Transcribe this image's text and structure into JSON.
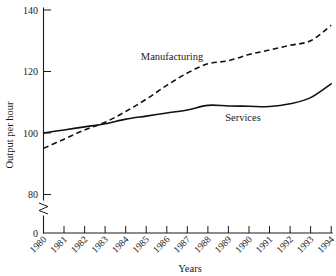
{
  "chart_data": {
    "type": "line",
    "title": "",
    "xlabel": "Years",
    "ylabel": "Output per hour",
    "x": [
      1980,
      1981,
      1982,
      1983,
      1984,
      1985,
      1986,
      1987,
      1988,
      1989,
      1990,
      1991,
      1992,
      1993,
      1994
    ],
    "categories": [
      "1980",
      "1981",
      "1982",
      "1983",
      "1984",
      "1985",
      "1986",
      "1987",
      "1988",
      "1989",
      "1990",
      "1991",
      "1992",
      "1993",
      "1994"
    ],
    "series": [
      {
        "name": "Manufacturing",
        "style": "dashed",
        "values": [
          95,
          98,
          101,
          103.5,
          107,
          111,
          115.5,
          119.5,
          122.5,
          123.5,
          125.5,
          127,
          128.5,
          130,
          135
        ]
      },
      {
        "name": "Services",
        "style": "solid",
        "values": [
          100,
          101,
          102,
          103,
          104.5,
          105.5,
          106.5,
          107.5,
          109,
          108.8,
          108.7,
          108.6,
          109.5,
          111.5,
          116
        ]
      }
    ],
    "ylim": [
      0,
      140
    ],
    "y_ticks": [
      0,
      80,
      100,
      120,
      140
    ],
    "y_tick_labels": [
      "0",
      "80",
      "100",
      "120",
      "140"
    ],
    "y_axis_break": true,
    "y_axis_break_between": [
      0,
      80
    ],
    "xlim": [
      1980,
      1994
    ],
    "grid": false,
    "legend": "inline-annotations",
    "annotations": [
      {
        "text": "Manufacturing",
        "x": 1986.1,
        "y": 127.8
      },
      {
        "text": "Services",
        "x": 1990.2,
        "y": 106.0
      }
    ],
    "line_color": "#111111"
  },
  "axis": {
    "y_title": "Output per hour",
    "x_title": "Years"
  },
  "ticks": {
    "y": [
      "140",
      "120",
      "100",
      "80",
      "0"
    ],
    "x": [
      "1980",
      "1981",
      "1982",
      "1983",
      "1984",
      "1985",
      "1986",
      "1987",
      "1988",
      "1989",
      "1990",
      "1991",
      "1992",
      "1993",
      "1994"
    ]
  },
  "labels": {
    "manufacturing": "Manufacturing",
    "services": "Services"
  }
}
